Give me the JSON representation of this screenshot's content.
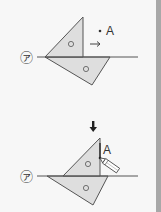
{
  "figure": {
    "type": "geometry-construction",
    "line_label": "㋐",
    "point_label": "A",
    "step1": {
      "caption_arrow": "→",
      "point": "A"
    },
    "step_arrow": "↓",
    "step2": {
      "point": "A",
      "tool": "pencil"
    },
    "colors": {
      "triangle_fill": "#dcdcdc",
      "stroke": "#555555",
      "edge_bar": "#a8a8a8"
    }
  }
}
